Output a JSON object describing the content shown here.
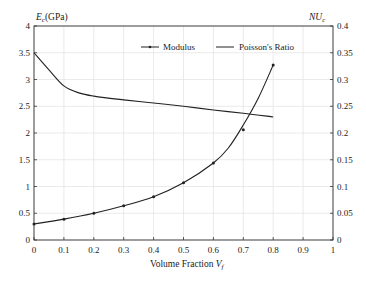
{
  "chart_data": {
    "type": "line",
    "title": "",
    "xlabel": "Volume Fraction V_f",
    "ylabel": "E_c(GPa)",
    "ylabel_right": "NU_c",
    "xlim": [
      0,
      1
    ],
    "ylim": [
      0,
      4
    ],
    "ylim_right": [
      0,
      0.4
    ],
    "x_ticks": [
      "0",
      "0.1",
      "0.2",
      "0.3",
      "0.4",
      "0.5",
      "0.6",
      "0.7",
      "0.8",
      "0.9",
      "1"
    ],
    "y_ticks": [
      "0",
      "0.5",
      "1",
      "1.5",
      "2",
      "2.5",
      "3",
      "3.5",
      "4"
    ],
    "y_ticks_right": [
      "0",
      "0.05",
      "0.1",
      "0.15",
      "0.2",
      "0.25",
      "0.3",
      "0.35",
      "0.4"
    ],
    "grid": true,
    "legend_position": "top-center",
    "series": [
      {
        "name": "Modulus",
        "axis": "left",
        "marker": "dot",
        "curve_x": [
          0,
          0.1,
          0.2,
          0.3,
          0.4,
          0.5,
          0.6,
          0.65,
          0.7,
          0.75,
          0.8
        ],
        "curve_y": [
          0.3,
          0.39,
          0.5,
          0.64,
          0.81,
          1.07,
          1.44,
          1.72,
          2.15,
          2.65,
          3.27
        ],
        "points_x": [
          0,
          0.1,
          0.2,
          0.3,
          0.4,
          0.5,
          0.6,
          0.7,
          0.8
        ],
        "points_y": [
          0.3,
          0.39,
          0.5,
          0.64,
          0.81,
          1.07,
          1.44,
          2.06,
          3.27
        ]
      },
      {
        "name": "Poisson's Ratio",
        "axis": "right",
        "marker": "none",
        "x": [
          0,
          0.05,
          0.1,
          0.15,
          0.2,
          0.3,
          0.4,
          0.5,
          0.6,
          0.7,
          0.8
        ],
        "values": [
          0.35,
          0.318,
          0.288,
          0.275,
          0.269,
          0.262,
          0.256,
          0.25,
          0.243,
          0.237,
          0.23
        ]
      }
    ]
  },
  "labels": {
    "y_left_main": "E",
    "y_left_sub": "c",
    "y_left_unit": "(GPa)",
    "y_right_main": "NU",
    "y_right_sub": "c",
    "x_main": "Volume Fraction ",
    "x_var": "V",
    "x_sub": "f"
  },
  "legend": [
    {
      "label": "Modulus"
    },
    {
      "label": "Poisson's Ratio"
    }
  ],
  "style": {
    "line_color": "#222222",
    "grid_color": "#e4e4e4",
    "axis_color": "#333333"
  }
}
